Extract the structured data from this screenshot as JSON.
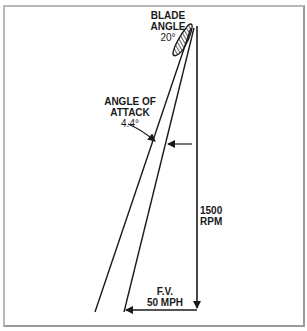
{
  "diagram": {
    "blade_angle": {
      "line1": "BLADE",
      "line2": "ANGLE",
      "value": "20°"
    },
    "angle_of_attack": {
      "line1": "ANGLE OF",
      "line2": "ATTACK",
      "value": "4.4°"
    },
    "rotation": {
      "value": "1500",
      "unit": "RPM"
    },
    "forward_velocity": {
      "label": "F.V.",
      "value": "50 MPH"
    },
    "colors": {
      "line": "#1a1a1a",
      "frame_light": "#b8b8b8",
      "frame_dark": "#9a9a9a",
      "background": "#ffffff"
    }
  }
}
